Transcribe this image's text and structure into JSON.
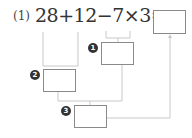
{
  "problem": {
    "number_label": "(1)",
    "expression": "28+12−7×3=",
    "answer_box": ""
  },
  "steps": [
    {
      "badge": "❶",
      "label": "1",
      "operation": "7×3",
      "value": ""
    },
    {
      "badge": "❷",
      "label": "2",
      "operation": "28+12",
      "value": ""
    },
    {
      "badge": "❸",
      "label": "3",
      "operation": "step2 − step1",
      "value": ""
    }
  ],
  "colors": {
    "line": "#c8c8c8",
    "box_border": "#8a8a8a",
    "badge": "#333333"
  }
}
